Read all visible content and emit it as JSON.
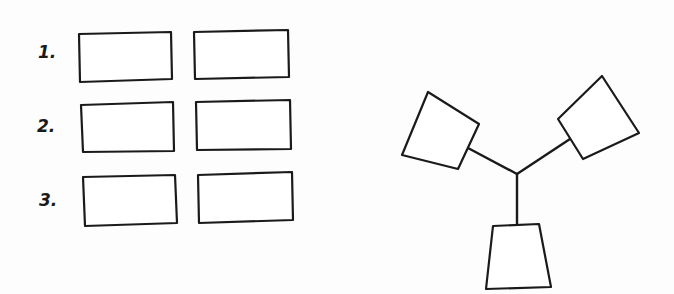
{
  "canvas": {
    "width": 674,
    "height": 294,
    "background": "#fdfdfd",
    "stroke_color": "#1a1a1a"
  },
  "grid": {
    "rows": [
      {
        "label": "1.",
        "label_pos": [
          38,
          58
        ],
        "boxes": [
          {
            "points": "79,34 171,32 172,79 80,82"
          },
          {
            "points": "194,32 288,30 289,77 195,79"
          }
        ]
      },
      {
        "label": "2.",
        "label_pos": [
          37,
          132
        ],
        "boxes": [
          {
            "points": "81,105 173,102 174,151 83,152"
          },
          {
            "points": "196,102 290,100 291,149 197,150"
          }
        ]
      },
      {
        "label": "3.",
        "label_pos": [
          39,
          206
        ],
        "boxes": [
          {
            "points": "83,177 175,175 177,223 85,226"
          },
          {
            "points": "198,175 292,172 293,220 199,223"
          }
        ]
      }
    ]
  },
  "tri_connector": {
    "hub": [
      517,
      174
    ],
    "arms": [
      {
        "name": "left",
        "box": "428,92 479,124 458,169 402,155",
        "line": [
          468,
          148
        ]
      },
      {
        "name": "right",
        "box": "602,76 639,133 583,159 558,119",
        "line": [
          570,
          139
        ]
      },
      {
        "name": "bottom",
        "box": "493,226 539,224 551,287 486,289",
        "line": [
          517,
          225
        ]
      }
    ]
  }
}
